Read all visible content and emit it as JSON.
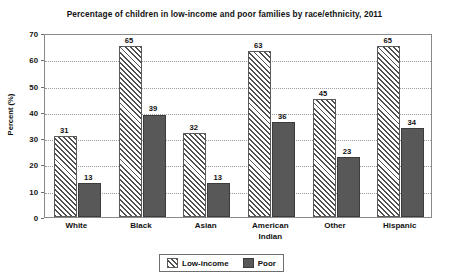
{
  "chart_data": {
    "type": "bar",
    "title": "Percentage of children in low-income and poor families by race/ethnicity, 2011",
    "xlabel": "",
    "ylabel": "Percent (%)",
    "ylim": [
      0,
      70
    ],
    "y_ticks": [
      0,
      10,
      20,
      30,
      40,
      50,
      60,
      70
    ],
    "grid": true,
    "legend_position": "bottom",
    "categories": [
      "White",
      "Black",
      "Asian",
      "American Indian",
      "Other",
      "Hispanic"
    ],
    "category_lines": [
      [
        "White"
      ],
      [
        "Black"
      ],
      [
        "Asian"
      ],
      [
        "American",
        "Indian"
      ],
      [
        "Other"
      ],
      [
        "Hispanic"
      ]
    ],
    "series": [
      {
        "name": "Low-income",
        "values": [
          31,
          65,
          32,
          63,
          45,
          65
        ],
        "fill": "diagonal-hatch",
        "color": "#4f4f4f"
      },
      {
        "name": "Poor",
        "values": [
          13,
          39,
          13,
          36,
          23,
          34
        ],
        "fill": "solid",
        "color": "#585858"
      }
    ]
  },
  "legend": {
    "entries": [
      {
        "label": "Low-income",
        "swatch": "hatched-swatch-icon"
      },
      {
        "label": "Poor",
        "swatch": "solid-swatch-icon"
      }
    ]
  }
}
